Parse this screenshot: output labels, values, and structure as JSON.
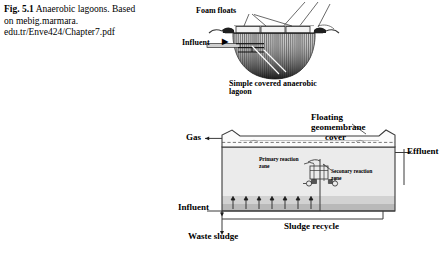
{
  "caption": {
    "figure_number": "Fig. 5.1",
    "title": "Anaerobic lagoons.",
    "source_line1": "Based on mebig.marmara.",
    "source_line2": "edu.tr/Enve424/Chapter7.pdf"
  },
  "figure_top": {
    "labels": {
      "foam_floats": "Foam floats",
      "influent": "Influent",
      "caption_line1": "Simple covered anaerobic",
      "caption_line2": "lagoon"
    },
    "arrow_glyph": "▶"
  },
  "figure_bottom": {
    "labels": {
      "gas": "Gas",
      "floating_cover_line1": "Floating",
      "floating_cover_line2": "geomembrane",
      "floating_cover_line3": "cover",
      "effluent": "Effluent",
      "influent": "Influent",
      "primary_zone_line1": "Primary reaction",
      "primary_zone_line2": "zone",
      "secondary_zone_line1": "Seconary reaction",
      "secondary_zone_line2": "zone",
      "waste_sludge": "Waste sludge",
      "sludge_recycle": "Sludge recycle"
    }
  },
  "colors": {
    "ink": "#000000",
    "line": "#4b4b4b",
    "tank_fill": "#e9e9e9",
    "sludge_fill": "#c8c8c8",
    "cover_fill": "#f4f4f4",
    "background": "#ffffff"
  }
}
